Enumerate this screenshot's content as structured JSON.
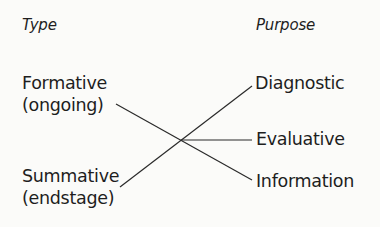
{
  "diagram": {
    "left_column": {
      "heading": "Type",
      "items": [
        {
          "label": "Formative",
          "sublabel": "(ongoing)"
        },
        {
          "label": "Summative",
          "sublabel": "(endstage)"
        }
      ]
    },
    "right_column": {
      "heading": "Purpose",
      "items": [
        {
          "label": "Diagnostic"
        },
        {
          "label": "Evaluative"
        },
        {
          "label": "Information"
        }
      ]
    },
    "connections": [
      {
        "from": "Formative",
        "to": "Information"
      },
      {
        "from": "Summative",
        "to": "Diagnostic"
      },
      {
        "from": "crossing",
        "to": "Evaluative"
      }
    ],
    "line_color": "#2a2a2a",
    "text_color": "#1e1e1e"
  }
}
